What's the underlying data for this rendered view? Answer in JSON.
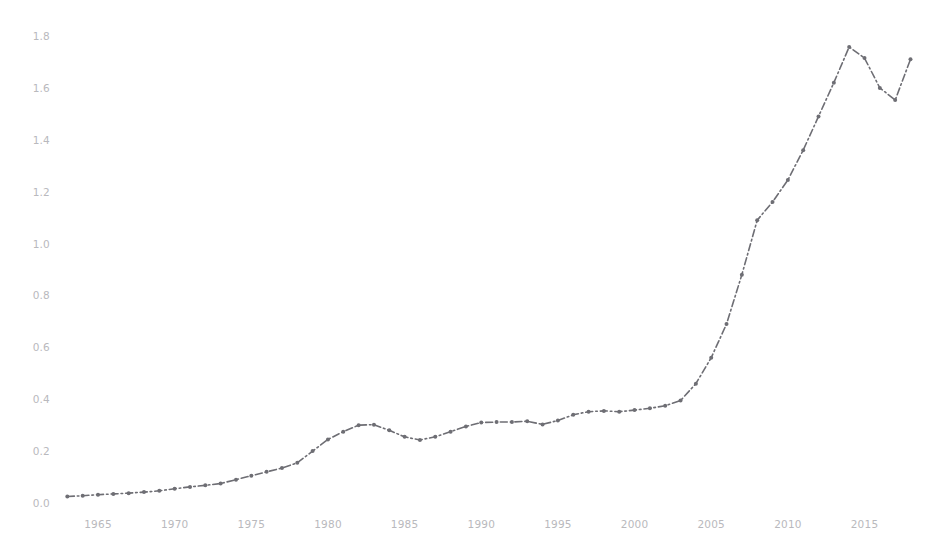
{
  "chart_data": {
    "type": "line",
    "title": "",
    "subtitle": "",
    "xlabel": "",
    "ylabel": "",
    "xlim": [
      1963,
      2018
    ],
    "ylim": [
      0.0,
      1.9
    ],
    "grid": false,
    "legend": null,
    "legend_position": "none",
    "annotations": [],
    "line_style": "dashdot",
    "line_color": "#6e6e74",
    "line_width": 1.6,
    "tick_label_color": "#b9b9bd",
    "background_color": "#ffffff",
    "x_ticks": [
      1965,
      1970,
      1975,
      1980,
      1985,
      1990,
      1995,
      2000,
      2005,
      2010,
      2015
    ],
    "x_tick_labels": [
      "1965",
      "1970",
      "1975",
      "1980",
      "1985",
      "1990",
      "1995",
      "2000",
      "2005",
      "2010",
      "2015"
    ],
    "y_ticks": [
      0.0,
      0.2,
      0.4,
      0.6,
      0.8,
      1.0,
      1.2,
      1.4,
      1.6,
      1.8
    ],
    "y_tick_labels": [
      "0.0",
      "0.2",
      "0.4",
      "0.6",
      "0.8",
      "1.0",
      "1.2",
      "1.4",
      "1.6",
      "1.8"
    ],
    "x": [
      1963,
      1964,
      1965,
      1966,
      1967,
      1968,
      1969,
      1970,
      1971,
      1972,
      1973,
      1974,
      1975,
      1976,
      1977,
      1978,
      1979,
      1980,
      1981,
      1982,
      1983,
      1984,
      1985,
      1986,
      1987,
      1988,
      1989,
      1990,
      1991,
      1992,
      1993,
      1994,
      1995,
      1996,
      1997,
      1998,
      1999,
      2000,
      2001,
      2002,
      2003,
      2004,
      2005,
      2006,
      2007,
      2008,
      2009,
      2010,
      2011,
      2012,
      2013,
      2014,
      2015,
      2016,
      2017,
      2018
    ],
    "values": [
      0.025,
      0.028,
      0.032,
      0.035,
      0.038,
      0.042,
      0.047,
      0.055,
      0.062,
      0.068,
      0.075,
      0.09,
      0.105,
      0.12,
      0.135,
      0.155,
      0.2,
      0.245,
      0.275,
      0.3,
      0.302,
      0.28,
      0.255,
      0.243,
      0.255,
      0.275,
      0.295,
      0.31,
      0.312,
      0.312,
      0.315,
      0.303,
      0.318,
      0.34,
      0.352,
      0.355,
      0.352,
      0.358,
      0.365,
      0.375,
      0.395,
      0.46,
      0.56,
      0.69,
      0.88,
      1.09,
      1.16,
      1.245,
      1.36,
      1.49,
      1.62,
      1.758,
      1.715,
      1.6,
      1.553,
      1.71
    ],
    "series_name": "value",
    "markers": true,
    "marker_size": 2.0
  },
  "axes": {
    "x_axis_visible": false,
    "y_axis_visible": false,
    "spines": "none"
  }
}
